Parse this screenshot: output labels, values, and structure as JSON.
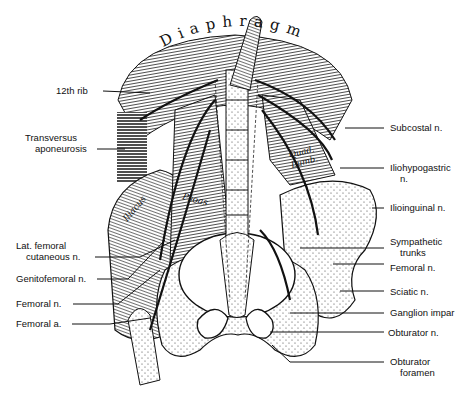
{
  "figure": {
    "title_arc": "Diaphragm",
    "muscle_labels": {
      "iliacus": "Iliacus",
      "psoas": "Psoas",
      "quad_lumb_line1": "Quad.",
      "quad_lumb_line2": "Lumb."
    },
    "left_labels": [
      {
        "line1": "12th rib",
        "line2": ""
      },
      {
        "line1": "Transversus",
        "line2": "aponeurosis"
      },
      {
        "line1": "Lat. femoral",
        "line2": "cutaneous n."
      },
      {
        "line1": "Genitofemoral n.",
        "line2": ""
      },
      {
        "line1": "Femoral n.",
        "line2": ""
      },
      {
        "line1": "Femoral a.",
        "line2": ""
      }
    ],
    "right_labels": [
      {
        "line1": "Subcostal n.",
        "line2": ""
      },
      {
        "line1": "Iliohypogastric",
        "line2": "n."
      },
      {
        "line1": "Ilioinguinal n.",
        "line2": ""
      },
      {
        "line1": "Sympathetic",
        "line2": "trunks"
      },
      {
        "line1": "Femoral n.",
        "line2": ""
      },
      {
        "line1": "Sciatic n.",
        "line2": ""
      },
      {
        "line1": "Ganglion impar",
        "line2": ""
      },
      {
        "line1": "Obturator n.",
        "line2": ""
      },
      {
        "line1": "Obturator",
        "line2": "foramen"
      }
    ]
  }
}
